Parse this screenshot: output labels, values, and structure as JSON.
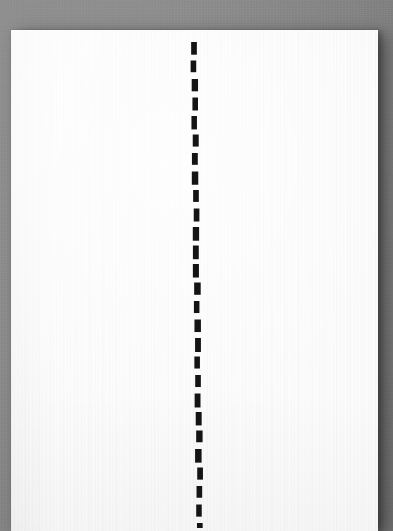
{
  "scene": {
    "title": "Dashed center line drawn on a sheet of white paper",
    "canvas": {
      "width": 393,
      "height": 531
    },
    "background_color": "#8a8a8a",
    "background_label": "gray surface"
  },
  "paper": {
    "label": "white paper sheet",
    "color": "#fbfbfc",
    "x": 11,
    "y": 30,
    "width": 367,
    "height": 501,
    "texture": "vertical fibre stripes",
    "shadow": "soft drop shadow to the lower-right"
  },
  "dashed_line": {
    "label": "vertical black dashed line",
    "color": "#141414",
    "stroke_width": 6,
    "dash_length": 13,
    "gap_length": 5.5,
    "period": 18.5,
    "start_x": 194,
    "start_y": 42,
    "end_x": 200,
    "end_y": 528,
    "dash_count": 27,
    "orientation": "vertical",
    "tilt_note": "drifts about 6 px to the right from top to bottom"
  },
  "chart_data": {
    "type": "line",
    "xlabel": "",
    "ylabel": "",
    "series": [
      {
        "name": "dashed-center-line",
        "style": "dashed",
        "color": "#141414",
        "x": [
          194,
          200
        ],
        "y": [
          42,
          528
        ]
      }
    ],
    "xlim": [
      0,
      393
    ],
    "ylim": [
      0,
      531
    ],
    "grid": false,
    "legend": "none"
  }
}
